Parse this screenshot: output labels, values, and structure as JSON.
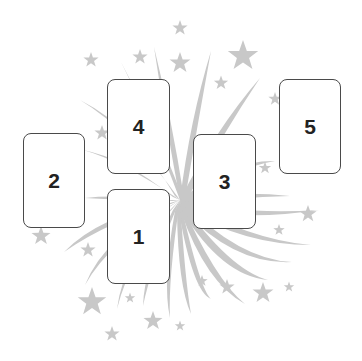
{
  "diagram": {
    "type": "card-spread-layout",
    "background": {
      "motif": "firework-burst-with-stars",
      "color": "#c8c8c8"
    },
    "card_style": {
      "fill": "#ffffff",
      "border": "#4a4a4a",
      "text_color": "#222222"
    },
    "cards": [
      {
        "position": 1,
        "label": "1",
        "x": 107,
        "y": 189,
        "w": 63,
        "h": 95
      },
      {
        "position": 2,
        "label": "2",
        "x": 23,
        "y": 133,
        "w": 62,
        "h": 95
      },
      {
        "position": 3,
        "label": "3",
        "x": 193,
        "y": 134,
        "w": 63,
        "h": 95
      },
      {
        "position": 4,
        "label": "4",
        "x": 107,
        "y": 79,
        "w": 63,
        "h": 95
      },
      {
        "position": 5,
        "label": "5",
        "x": 279,
        "y": 79,
        "w": 62,
        "h": 95
      }
    ]
  }
}
